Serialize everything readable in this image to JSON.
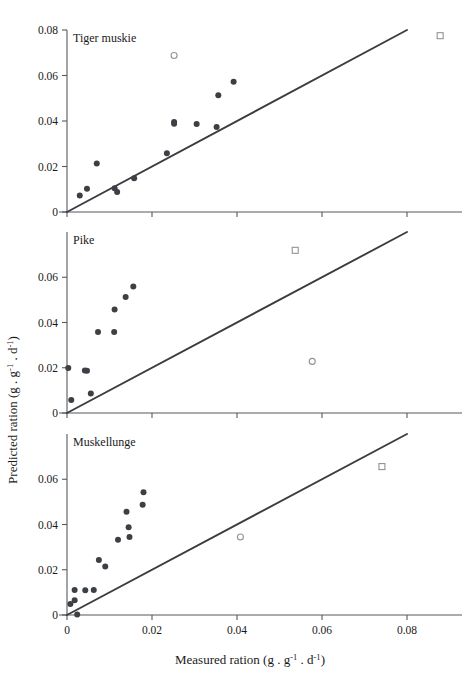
{
  "figure": {
    "background_color": "#ffffff",
    "point_color": "#3c3f44",
    "line_color": "#3a3c40",
    "axis_color": "#555a5e",
    "outlier_color": "#8f9398"
  },
  "axes": {
    "x_title_main": "Measured ration (g . g",
    "x_title_sup1": "-1",
    "x_title_mid": " . d",
    "x_title_sup2": "-1",
    "x_title_end": ")",
    "y_title_main": "Predicted ration (g . g",
    "y_title_sup1": "-1",
    "y_title_mid": " . d",
    "y_title_sup2": "-1",
    "y_title_end": ")",
    "x_ticks": [
      "0",
      "0.02",
      "0.04",
      "0.06",
      "0.08"
    ],
    "x_tick_values": [
      0,
      0.02,
      0.04,
      0.06,
      0.08
    ],
    "y_ticks": [
      "0",
      "0.02",
      "0.04",
      "0.06",
      "0.08"
    ],
    "y_tick_values": [
      0,
      0.02,
      0.04,
      0.06,
      0.08
    ],
    "xlim": [
      0,
      0.09
    ],
    "ylim": [
      0,
      0.08
    ]
  },
  "chart_data": [
    {
      "type": "scatter",
      "title": "Tiger muskie",
      "panel": 1,
      "xlabel": "Measured ration (g . g-1 . d-1)",
      "ylabel": "Predicted ration (g . g-1 . d-1)",
      "xlim": [
        0,
        0.09
      ],
      "ylim": [
        0,
        0.08
      ],
      "grid": false,
      "legend": "none",
      "reference_line": {
        "label": "1:1 line",
        "from": [
          0,
          0
        ],
        "to": [
          0.08,
          0.08
        ]
      },
      "series": [
        {
          "name": "Observations",
          "marker": "filled-circle",
          "points": [
            [
              0.003,
              0.0073
            ],
            [
              0.0047,
              0.0102
            ],
            [
              0.007,
              0.0213
            ],
            [
              0.0112,
              0.0104
            ],
            [
              0.0118,
              0.0088
            ],
            [
              0.0158,
              0.0148
            ],
            [
              0.0235,
              0.0258
            ],
            [
              0.0252,
              0.0396
            ],
            [
              0.0252,
              0.0388
            ],
            [
              0.0305,
              0.0387
            ],
            [
              0.0352,
              0.0374
            ],
            [
              0.0356,
              0.0513
            ],
            [
              0.0392,
              0.0573
            ]
          ]
        },
        {
          "name": "Excluded outlier (circle)",
          "marker": "open-circle",
          "points": [
            [
              0.0252,
              0.0688
            ]
          ]
        },
        {
          "name": "Excluded outlier (square)",
          "marker": "open-square",
          "points": [
            [
              0.0878,
              0.0775
            ]
          ]
        }
      ]
    },
    {
      "type": "scatter",
      "title": "Pike",
      "panel": 2,
      "xlabel": "Measured ration (g . g-1 . d-1)",
      "ylabel": "Predicted ration (g . g-1 . d-1)",
      "xlim": [
        0,
        0.09
      ],
      "ylim": [
        0,
        0.08
      ],
      "grid": false,
      "legend": "none",
      "reference_line": {
        "label": "1:1 line",
        "from": [
          0,
          0
        ],
        "to": [
          0.08,
          0.08
        ]
      },
      "series": [
        {
          "name": "Observations",
          "marker": "filled-circle",
          "points": [
            [
              0.0003,
              0.0199
            ],
            [
              0.001,
              0.0058
            ],
            [
              0.0042,
              0.0188
            ],
            [
              0.0047,
              0.0187
            ],
            [
              0.0056,
              0.0086
            ],
            [
              0.0073,
              0.0358
            ],
            [
              0.0112,
              0.0457
            ],
            [
              0.0111,
              0.0358
            ],
            [
              0.0138,
              0.0513
            ],
            [
              0.0156,
              0.0559
            ]
          ]
        },
        {
          "name": "Excluded outlier (circle)",
          "marker": "open-circle",
          "points": [
            [
              0.0577,
              0.0228
            ]
          ]
        },
        {
          "name": "Excluded outlier (square)",
          "marker": "open-square",
          "points": [
            [
              0.0537,
              0.0719
            ]
          ]
        }
      ]
    },
    {
      "type": "scatter",
      "title": "Muskellunge",
      "panel": 3,
      "xlabel": "Measured ration (g . g-1 . d-1)",
      "ylabel": "Predicted ration (g . g-1 . d-1)",
      "xlim": [
        0,
        0.09
      ],
      "ylim": [
        0,
        0.08
      ],
      "grid": false,
      "legend": "none",
      "reference_line": {
        "label": "1:1 line",
        "from": [
          0,
          0
        ],
        "to": [
          0.08,
          0.08
        ]
      },
      "series": [
        {
          "name": "Observations",
          "marker": "filled-circle",
          "points": [
            [
              0.0008,
              0.0049
            ],
            [
              0.0018,
              0.0065
            ],
            [
              0.0024,
              0.0002
            ],
            [
              0.0018,
              0.011
            ],
            [
              0.0043,
              0.0109
            ],
            [
              0.0063,
              0.011
            ],
            [
              0.0075,
              0.0243
            ],
            [
              0.009,
              0.0214
            ],
            [
              0.012,
              0.0333
            ],
            [
              0.014,
              0.0456
            ],
            [
              0.0145,
              0.0388
            ],
            [
              0.0147,
              0.0345
            ],
            [
              0.0178,
              0.0487
            ],
            [
              0.018,
              0.0543
            ]
          ]
        },
        {
          "name": "Excluded outlier (circle)",
          "marker": "open-circle",
          "points": [
            [
              0.0408,
              0.0345
            ]
          ]
        },
        {
          "name": "Excluded outlier (square)",
          "marker": "open-square",
          "points": [
            [
              0.0741,
              0.0656
            ]
          ]
        }
      ]
    }
  ]
}
